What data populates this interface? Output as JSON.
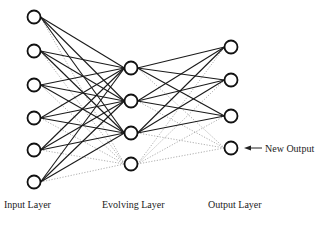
{
  "diagram": {
    "type": "neural-network",
    "layers": [
      {
        "name": "input",
        "label": "Input Layer",
        "x": 34,
        "nodes": [
          17,
          51,
          85,
          118,
          150,
          182
        ]
      },
      {
        "name": "evolving",
        "label": "Evolving Layer",
        "x": 131,
        "nodes": [
          68,
          101,
          133,
          164
        ],
        "new_nodes": [
          3
        ]
      },
      {
        "name": "output",
        "label": "Output Layer",
        "x": 231,
        "nodes": [
          47,
          80,
          116,
          148
        ],
        "new_nodes": [
          3
        ]
      }
    ],
    "annotation": {
      "label": "New Output",
      "target": "output-node-4"
    },
    "node_radius": 6.5,
    "colors": {
      "solid": "#1a1a1a",
      "dotted": "#9a9a9a",
      "node_stroke": "#111111",
      "background": "#ffffff"
    }
  },
  "labels": {
    "input": "Input Layer",
    "evolving": "Evolving Layer",
    "output": "Output Layer",
    "new_output": "New Output"
  }
}
